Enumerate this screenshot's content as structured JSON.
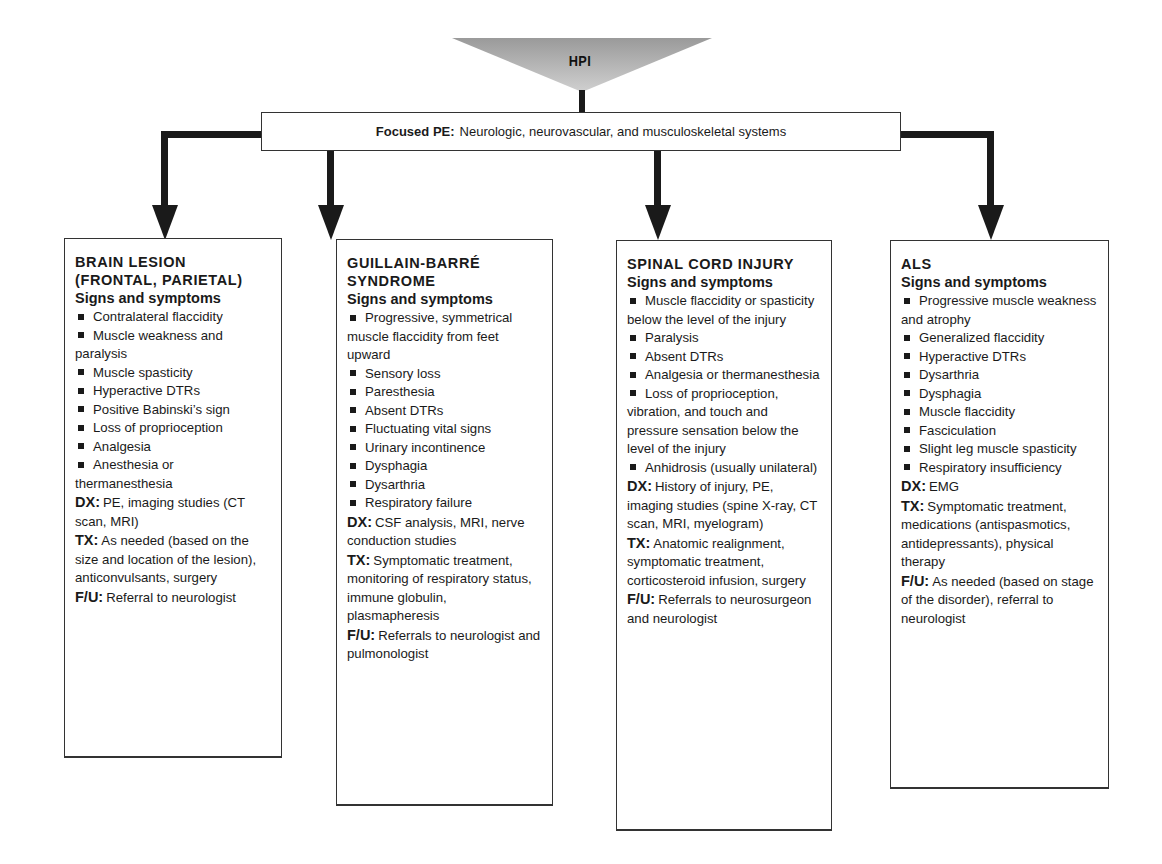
{
  "hpi": {
    "label": "HPI",
    "fill_color": "#b8b8b8"
  },
  "focused_pe": {
    "label": "Focused PE:",
    "text": "Neurologic, neurovascular, and musculoskeletal systems"
  },
  "connector_color": "#1a1a1a",
  "boxes": [
    {
      "title_lines": [
        "BRAIN LESION",
        "(FRONTAL, PARIETAL)"
      ],
      "signs_heading": "Signs and symptoms",
      "signs": [
        "Contralateral flaccidity",
        "Muscle weakness and paralysis",
        "Muscle spasticity",
        "Hyperactive DTRs",
        "Positive Babinski’s sign",
        "Loss of proprioception",
        "Analgesia",
        "Anesthesia or thermanesthesia"
      ],
      "dx_label": "DX:",
      "dx": "PE, imaging studies (CT scan, MRI)",
      "tx_label": "TX:",
      "tx": "As needed (based on the size and location of the lesion), anticonvulsants, surgery",
      "fu_label": "F/U:",
      "fu": "Referral to neurologist"
    },
    {
      "title_lines": [
        "GUILLAIN-BARRÉ",
        "SYNDROME"
      ],
      "signs_heading": "Signs and symptoms",
      "signs": [
        "Progressive, symmetrical muscle flaccidity from feet upward",
        "Sensory loss",
        "Paresthesia",
        "Absent DTRs",
        "Fluctuating vital signs",
        "Urinary incontinence",
        "Dysphagia",
        "Dysarthria",
        "Respiratory failure"
      ],
      "dx_label": "DX:",
      "dx": "CSF analysis, MRI, nerve conduction studies",
      "tx_label": "TX:",
      "tx": "Symptomatic treatment, monitoring of respiratory status, immune globulin, plasmapheresis",
      "fu_label": "F/U:",
      "fu": "Referrals to neurologist and pulmonologist"
    },
    {
      "title_lines": [
        "SPINAL CORD INJURY"
      ],
      "signs_heading": "Signs and symptoms",
      "signs": [
        "Muscle flaccidity or spasticity below the level of the injury",
        "Paralysis",
        "Absent DTRs",
        "Analgesia or thermanesthesia",
        "Loss of proprioception, vibration, and touch and pressure sensation below the level of the injury",
        "Anhidrosis (usually unilateral)"
      ],
      "dx_label": "DX:",
      "dx": "History of injury, PE, imaging studies (spine X-ray, CT scan, MRI, myelogram)",
      "tx_label": "TX:",
      "tx": "Anatomic realignment, symptomatic treatment, corticosteroid infusion, surgery",
      "fu_label": "F/U:",
      "fu": "Referrals to neurosurgeon and neurologist"
    },
    {
      "title_lines": [
        "ALS"
      ],
      "signs_heading": "Signs and symptoms",
      "signs": [
        "Progressive muscle weakness and atrophy",
        "Generalized flaccidity",
        "Hyperactive DTRs",
        "Dysarthria",
        "Dysphagia",
        "Muscle flaccidity",
        "Fasciculation",
        "Slight leg muscle spasticity",
        "Respiratory insufficiency"
      ],
      "dx_label": "DX:",
      "dx": "EMG",
      "tx_label": "TX:",
      "tx": "Symptomatic treatment, medications (antispasmotics, antidepressants), physical therapy",
      "fu_label": "F/U:",
      "fu": "As needed (based on stage of the disorder), referral to neurologist"
    }
  ]
}
